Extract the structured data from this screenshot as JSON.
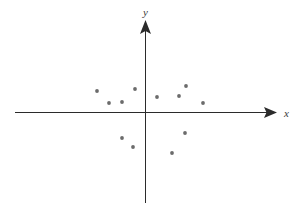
{
  "figure": {
    "title": "",
    "background_color": "#ffffff",
    "width": 298,
    "height": 208
  },
  "axes": {
    "x_label": "x",
    "y_label": "y",
    "axis_color": "#2b2b2b",
    "origin_px": {
      "x": 145.5,
      "y": 112.5
    },
    "x_axis_start_px": 15,
    "x_axis_end_px": 277,
    "y_axis_top_px": 20,
    "y_axis_bottom_px": 203,
    "x_arrow": "right-arrow-icon",
    "y_arrow": "up-arrow-icon"
  },
  "chart_data": {
    "type": "scatter",
    "title": "",
    "xlabel": "x",
    "ylabel": "y",
    "grid": false,
    "legend": "none",
    "point_color": "#6b6b6b",
    "point_radius": 1.9,
    "xlim": [
      -130,
      132
    ],
    "ylim": [
      -91,
      93
    ],
    "x": [
      -48.5,
      -36.5,
      -23.5,
      -10.5,
      11.5,
      33.5,
      40.5,
      57.5,
      -23.5,
      -12.5,
      39.5,
      26.5
    ],
    "y": [
      21.5,
      9.5,
      10.5,
      23.5,
      15.5,
      16.5,
      26.5,
      9.5,
      -25.5,
      -34.5,
      -20.5,
      -40.5
    ],
    "points": [
      {
        "x": -48.5,
        "y": 21.5,
        "quadrant": "II"
      },
      {
        "x": -36.5,
        "y": 9.5,
        "quadrant": "II"
      },
      {
        "x": -23.5,
        "y": 10.5,
        "quadrant": "II"
      },
      {
        "x": -10.5,
        "y": 23.5,
        "quadrant": "II"
      },
      {
        "x": 11.5,
        "y": 15.5,
        "quadrant": "I"
      },
      {
        "x": 33.5,
        "y": 16.5,
        "quadrant": "I"
      },
      {
        "x": 40.5,
        "y": 26.5,
        "quadrant": "I"
      },
      {
        "x": 57.5,
        "y": 9.5,
        "quadrant": "I"
      },
      {
        "x": -23.5,
        "y": -25.5,
        "quadrant": "III"
      },
      {
        "x": -12.5,
        "y": -34.5,
        "quadrant": "III"
      },
      {
        "x": 39.5,
        "y": -20.5,
        "quadrant": "IV"
      },
      {
        "x": 26.5,
        "y": -40.5,
        "quadrant": "IV"
      }
    ],
    "point_count": 12
  }
}
